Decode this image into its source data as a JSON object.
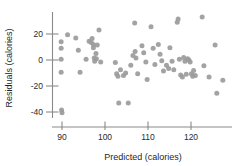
{
  "chart_data": {
    "type": "scatter",
    "title": "",
    "xlabel": "Predicted (calories)",
    "ylabel": "Residuals (calories)",
    "xlim": [
      86,
      130
    ],
    "ylim": [
      -44,
      34
    ],
    "xticks": [
      90,
      100,
      110,
      120
    ],
    "yticks": [
      20,
      0,
      -20,
      -40
    ],
    "xticklabels": [
      "90",
      "100",
      "110",
      "120"
    ],
    "yticklabels": [
      "20",
      "0",
      "-20",
      "-40"
    ],
    "grid": false,
    "legend": false,
    "marker_color": "#9b9b9b",
    "axis_color": "#8a8a8a",
    "points": [
      [
        89.8,
        14.0
      ],
      [
        89.8,
        9.0
      ],
      [
        89.8,
        0.5
      ],
      [
        89.8,
        -9.5
      ],
      [
        89.9,
        -38.5
      ],
      [
        90.0,
        -40.5
      ],
      [
        91.3,
        19.5
      ],
      [
        93.2,
        17.0
      ],
      [
        93.8,
        7.5
      ],
      [
        94.2,
        -9.5
      ],
      [
        95.6,
        0.5
      ],
      [
        96.3,
        14.5
      ],
      [
        96.8,
        13.5
      ],
      [
        97.0,
        16.5
      ],
      [
        97.3,
        12.0
      ],
      [
        97.3,
        9.5
      ],
      [
        97.5,
        1.5
      ],
      [
        97.6,
        -1.0
      ],
      [
        97.9,
        5.0
      ],
      [
        98.0,
        1.0
      ],
      [
        98.2,
        11.5
      ],
      [
        98.6,
        23.0
      ],
      [
        99.0,
        -1.5
      ],
      [
        102.4,
        -2.0
      ],
      [
        102.7,
        -10.5
      ],
      [
        103.0,
        -12.5
      ],
      [
        103.2,
        -33.0
      ],
      [
        103.6,
        -7.5
      ],
      [
        104.3,
        -12.0
      ],
      [
        104.8,
        -10.0
      ],
      [
        105.4,
        -33.0
      ],
      [
        106.0,
        -4.0
      ],
      [
        106.5,
        3.5
      ],
      [
        106.9,
        28.5
      ],
      [
        107.0,
        6.5
      ],
      [
        107.2,
        1.5
      ],
      [
        107.6,
        -10.5
      ],
      [
        108.6,
        11.0
      ],
      [
        109.0,
        5.5
      ],
      [
        109.5,
        -1.5
      ],
      [
        109.8,
        -15.0
      ],
      [
        110.7,
        25.5
      ],
      [
        111.2,
        9.0
      ],
      [
        111.6,
        -3.5
      ],
      [
        112.4,
        12.0
      ],
      [
        112.8,
        4.5
      ],
      [
        113.2,
        -0.5
      ],
      [
        113.6,
        -8.5
      ],
      [
        114.3,
        -4.0
      ],
      [
        114.8,
        -6.5
      ],
      [
        115.1,
        9.5
      ],
      [
        115.6,
        -1.0
      ],
      [
        116.0,
        -7.5
      ],
      [
        116.8,
        29.0
      ],
      [
        117.0,
        31.5
      ],
      [
        117.3,
        0.5
      ],
      [
        117.6,
        -11.5
      ],
      [
        118.0,
        -13.0
      ],
      [
        118.3,
        2.0
      ],
      [
        118.6,
        -1.0
      ],
      [
        118.9,
        -11.0
      ],
      [
        119.2,
        1.0
      ],
      [
        119.5,
        0.0
      ],
      [
        119.8,
        -1.5
      ],
      [
        120.1,
        -10.5
      ],
      [
        120.4,
        -12.5
      ],
      [
        120.6,
        -8.0
      ],
      [
        121.0,
        -12.0
      ],
      [
        122.6,
        33.0
      ],
      [
        123.0,
        -4.5
      ],
      [
        124.2,
        -13.0
      ],
      [
        125.6,
        11.5
      ],
      [
        126.0,
        -25.5
      ],
      [
        127.4,
        -15.5
      ]
    ]
  }
}
